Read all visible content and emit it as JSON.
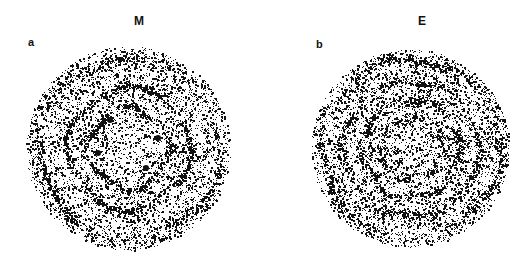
{
  "figure": {
    "panels": [
      {
        "id": "a",
        "label": "a",
        "title": "M",
        "center": [
          128,
          148
        ],
        "radius": 100,
        "dot_color": "#111111",
        "rings": [
          {
            "r": 0.9,
            "width": 0.05,
            "strength": 0.6
          },
          {
            "r": 0.6,
            "width": 0.035,
            "strength": 1.0
          },
          {
            "r": 0.4,
            "width": 0.03,
            "strength": 0.9
          }
        ],
        "spots": [
          [
            -0.18,
            -0.28
          ],
          [
            0.18,
            0.2
          ],
          [
            -0.3,
            0.05
          ],
          [
            0.3,
            -0.1
          ]
        ]
      },
      {
        "id": "b",
        "label": "b",
        "title": "E",
        "center": [
          410,
          148
        ],
        "radius": 97,
        "dot_color": "#111111",
        "rings": [
          {
            "r": 0.92,
            "width": 0.05,
            "strength": 0.7
          },
          {
            "r": 0.7,
            "width": 0.04,
            "strength": 0.6
          },
          {
            "r": 0.5,
            "width": 0.035,
            "strength": 0.8
          },
          {
            "r": 0.3,
            "width": 0.03,
            "strength": 0.6
          }
        ],
        "spots": []
      }
    ]
  }
}
